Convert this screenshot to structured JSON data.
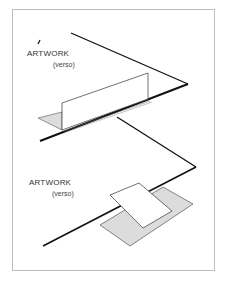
{
  "diagram": {
    "top_panel": {
      "label": "ARTWORK",
      "sublabel": "(verso)",
      "description": "artwork standing upright along a fold line"
    },
    "bottom_panel": {
      "label": "ARTWORK",
      "sublabel": "(verso)",
      "description": "artwork lying flat over a shaded mount"
    },
    "colors": {
      "line": "#111111",
      "shade": "#dcdcdc",
      "frame": "#bdbdbd"
    }
  }
}
